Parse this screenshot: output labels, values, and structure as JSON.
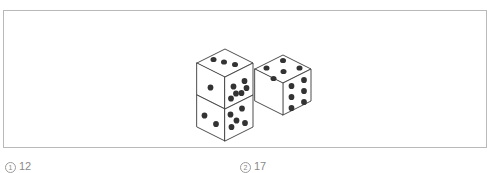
{
  "figure": {
    "name": "three-dice-isometric-illustration",
    "frame": {
      "border_color": "#b9b9b9",
      "background": "#ffffff"
    },
    "style": {
      "edge_color": "#3a3a3a",
      "face_fill": "#ffffff",
      "pip_color": "#333333",
      "pip_radius": 3.0,
      "stroke_width": 0.9
    },
    "dice": [
      {
        "id": "upper-left-die",
        "position": "top of left stack",
        "faces": [
          {
            "name": "top-face",
            "pips": 3
          },
          {
            "name": "left-face",
            "pips": 1
          },
          {
            "name": "right-face",
            "pips": 6
          }
        ]
      },
      {
        "id": "lower-left-die",
        "position": "bottom of left stack",
        "faces": [
          {
            "name": "left-face",
            "pips": 2
          },
          {
            "name": "right-face",
            "pips": 5
          }
        ]
      },
      {
        "id": "right-die",
        "position": "right of lower-left die",
        "faces": [
          {
            "name": "top-face",
            "pips": 5
          },
          {
            "name": "right-face",
            "pips": 6
          }
        ]
      }
    ]
  },
  "captions": {
    "left": {
      "marker": "1",
      "text": "12"
    },
    "right": {
      "marker": "2",
      "text": "17"
    }
  }
}
